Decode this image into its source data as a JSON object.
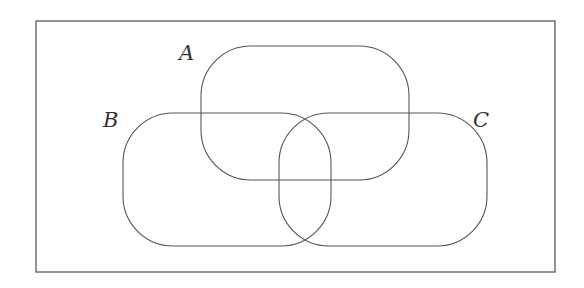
{
  "diagram": {
    "type": "venn",
    "frame": {
      "x": 36,
      "y": 21,
      "width": 519,
      "height": 251
    },
    "sets": [
      {
        "name": "A",
        "label": "A",
        "x": 201,
        "y": 46,
        "width": 208,
        "height": 134,
        "rx": 50,
        "label_x": 179,
        "label_y": 60
      },
      {
        "name": "B",
        "label": "B",
        "x": 123,
        "y": 113,
        "width": 208,
        "height": 133,
        "rx": 50,
        "label_x": 103,
        "label_y": 127
      },
      {
        "name": "C",
        "label": "C",
        "x": 279,
        "y": 113,
        "width": 208,
        "height": 133,
        "rx": 50,
        "label_x": 473,
        "label_y": 127
      }
    ],
    "colors": {
      "stroke": "#555555",
      "frame": "#666666",
      "background": "#ffffff"
    }
  }
}
